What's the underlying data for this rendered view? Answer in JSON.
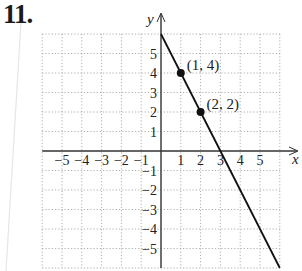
{
  "problem": {
    "number": "11."
  },
  "chart_data": {
    "type": "line",
    "title": "",
    "xlabel": "x",
    "ylabel": "y",
    "xlim": [
      -6,
      6
    ],
    "ylim": [
      -6,
      6
    ],
    "grid": true,
    "x_ticks": [
      -5,
      -4,
      -3,
      -2,
      -1,
      1,
      2,
      3,
      4,
      5
    ],
    "y_ticks": [
      -5,
      -4,
      -3,
      -2,
      -1,
      1,
      2,
      3,
      4,
      5
    ],
    "x_tick_labels": [
      "−5",
      "−4",
      "−3",
      "−2",
      "−1",
      "1",
      "2",
      "3",
      "4",
      "5"
    ],
    "y_tick_labels": [
      "5",
      "4",
      "3",
      "2",
      "1",
      "−1",
      "−2",
      "−3",
      "−4",
      "−5"
    ],
    "series": [
      {
        "name": "y = -2x + 6",
        "x": [
          0,
          6
        ],
        "y": [
          6,
          -6
        ]
      }
    ],
    "points": [
      {
        "x": 1,
        "y": 4,
        "label": "(1, 4)"
      },
      {
        "x": 2,
        "y": 2,
        "label": "(2, 2)"
      }
    ],
    "colors": {
      "line": "#111111",
      "grid": "#9a9a9a",
      "axis": "#333333",
      "text": "#222222"
    }
  }
}
